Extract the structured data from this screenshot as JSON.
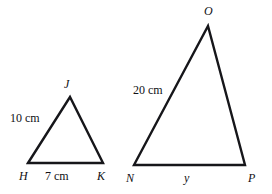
{
  "diagram": {
    "type": "similar-triangles",
    "background_color": "#ffffff",
    "stroke_color": "#16161a",
    "text_color": "#101014",
    "figures": [
      {
        "name": "triangle-hjk",
        "vertices": [
          {
            "label": "H",
            "x": 28,
            "y": 163
          },
          {
            "label": "J",
            "x": 70,
            "y": 97
          },
          {
            "label": "K",
            "x": 103,
            "y": 163
          }
        ],
        "side_labels": [
          {
            "text": "10 cm",
            "side": "HJ"
          },
          {
            "text": "7 cm",
            "side": "HK"
          }
        ]
      },
      {
        "name": "triangle-nop",
        "vertices": [
          {
            "label": "N",
            "x": 134,
            "y": 165
          },
          {
            "label": "O",
            "x": 208,
            "y": 26
          },
          {
            "label": "P",
            "x": 245,
            "y": 165
          }
        ],
        "side_labels": [
          {
            "text": "20 cm",
            "side": "NO"
          },
          {
            "text": "y",
            "side": "NP"
          }
        ]
      }
    ],
    "labels": {
      "vertex_h": "H",
      "vertex_j": "J",
      "vertex_k": "K",
      "vertex_n": "N",
      "vertex_o": "O",
      "vertex_p": "P",
      "side_hj": "10 cm",
      "side_hk": "7 cm",
      "side_no": "20 cm",
      "side_np": "y"
    }
  }
}
